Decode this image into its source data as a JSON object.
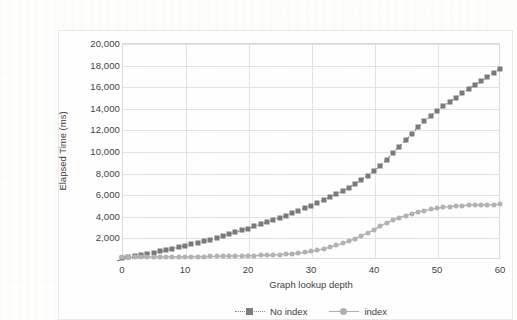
{
  "chart_data": {
    "type": "line",
    "title": "",
    "xlabel": "Graph lookup depth",
    "ylabel": "Elapsed Time (ms)",
    "xlim": [
      0,
      60
    ],
    "ylim": [
      0,
      20000
    ],
    "grid": true,
    "legend_position": "bottom",
    "x_ticks": [
      "0",
      "10",
      "20",
      "30",
      "40",
      "50",
      "60"
    ],
    "x_tick_values": [
      0,
      10,
      20,
      30,
      40,
      50,
      60
    ],
    "y_ticks": [
      "-",
      "2,000",
      "4,000",
      "6,000",
      "8,000",
      "10,000",
      "12,000",
      "14,000",
      "16,000",
      "18,000",
      "20,000"
    ],
    "y_tick_values": [
      0,
      2000,
      4000,
      6000,
      8000,
      10000,
      12000,
      14000,
      16000,
      18000,
      20000
    ],
    "x": [
      0,
      1,
      2,
      3,
      4,
      5,
      6,
      7,
      8,
      9,
      10,
      11,
      12,
      13,
      14,
      15,
      16,
      17,
      18,
      19,
      20,
      21,
      22,
      23,
      24,
      25,
      26,
      27,
      28,
      29,
      30,
      31,
      32,
      33,
      34,
      35,
      36,
      37,
      38,
      39,
      40,
      41,
      42,
      43,
      44,
      45,
      46,
      47,
      48,
      49,
      50,
      51,
      52,
      53,
      54,
      55,
      56,
      57,
      58,
      59,
      60
    ],
    "series": [
      {
        "name": "No index",
        "marker": "square",
        "linestyle": "dotted",
        "color": "#7a7a7a",
        "values": [
          120,
          180,
          260,
          360,
          470,
          580,
          700,
          820,
          950,
          1080,
          1220,
          1360,
          1500,
          1650,
          1800,
          1960,
          2120,
          2290,
          2460,
          2640,
          2820,
          3010,
          3200,
          3400,
          3600,
          3810,
          4020,
          4240,
          4470,
          4700,
          4940,
          5190,
          5450,
          5720,
          6000,
          6300,
          6620,
          6960,
          7330,
          7720,
          8150,
          8650,
          9200,
          9800,
          10400,
          11000,
          11600,
          12200,
          12750,
          13250,
          13700,
          14150,
          14550,
          14950,
          15350,
          15750,
          16100,
          16450,
          16850,
          17250,
          17600
        ]
      },
      {
        "name": "index",
        "marker": "circle",
        "linestyle": "solid",
        "color": "#b2b2b2",
        "values": [
          160,
          170,
          175,
          180,
          185,
          190,
          195,
          200,
          205,
          210,
          215,
          220,
          225,
          230,
          235,
          245,
          255,
          265,
          275,
          285,
          300,
          315,
          330,
          350,
          375,
          405,
          440,
          485,
          540,
          610,
          700,
          810,
          940,
          1090,
          1260,
          1450,
          1660,
          1890,
          2140,
          2410,
          2700,
          3050,
          3350,
          3600,
          3820,
          4020,
          4200,
          4360,
          4490,
          4600,
          4700,
          4780,
          4850,
          4900,
          4940,
          4980,
          5000,
          5000,
          5010,
          5030,
          5060
        ]
      }
    ]
  },
  "legend": {
    "entries": [
      {
        "label": "No index"
      },
      {
        "label": "index"
      }
    ]
  }
}
